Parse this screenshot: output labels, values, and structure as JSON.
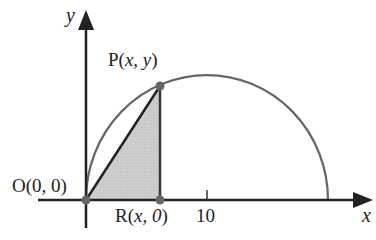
{
  "diagram": {
    "axes": {
      "x_label": "x",
      "y_label": "y",
      "x_tick_label": "10"
    },
    "points": {
      "origin": "O(0, 0)",
      "P": {
        "name": "P",
        "coords": "x, y"
      },
      "R": {
        "name": "R",
        "coords": "x, 0"
      }
    },
    "colors": {
      "curve": "#666666",
      "axis": "#222222",
      "shade": "#c8c8c8",
      "point": "#666666"
    }
  }
}
